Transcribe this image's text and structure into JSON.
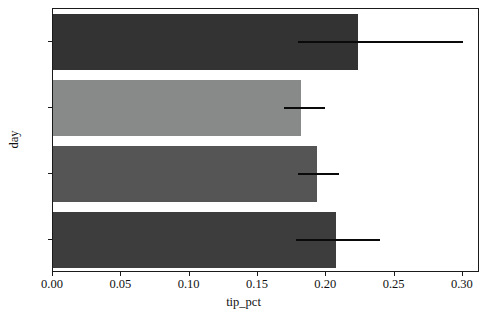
{
  "chart_data": {
    "type": "bar",
    "orientation": "horizontal",
    "title": "",
    "xlabel": "tip_pct",
    "ylabel": "day",
    "categories": [
      "Sun",
      "Sat",
      "Thur",
      "Fri"
    ],
    "values": [
      0.2235,
      0.1815,
      0.1935,
      0.2072
    ],
    "errors_low": [
      0.179,
      0.169,
      0.179,
      0.178
    ],
    "errors_high": [
      0.3,
      0.199,
      0.209,
      0.239
    ],
    "bar_colors": [
      "#333333",
      "#888a8a",
      "#555555",
      "#3d3d3d"
    ],
    "xlim": [
      0.0,
      0.3125
    ],
    "xticks": [
      0.0,
      0.05,
      0.1,
      0.15,
      0.2,
      0.25,
      0.3
    ],
    "xtick_labels": [
      "0.00",
      "0.05",
      "0.10",
      "0.15",
      "0.20",
      "0.25",
      "0.30"
    ],
    "grid": false,
    "legend": null,
    "errorbar_color": "#0a0a0a"
  }
}
